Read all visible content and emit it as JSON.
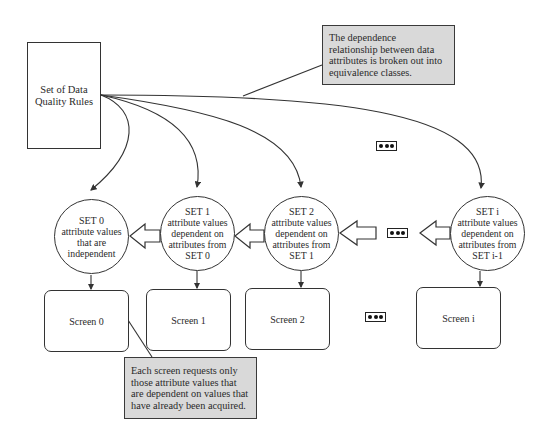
{
  "rules_box": {
    "label_line1": "Set of Data",
    "label_line2": "Quality Rules"
  },
  "callouts": {
    "top": {
      "lines": [
        "The dependence",
        "relationship between data",
        "attributes is broken out into",
        "equivalence classes."
      ]
    },
    "bottom": {
      "lines": [
        "Each screen requests only",
        "those attribute values that",
        "are dependent on values that",
        "have already been acquired."
      ]
    }
  },
  "sets": [
    {
      "title": "SET 0",
      "lines": [
        "attribute values",
        "that are",
        "independent"
      ]
    },
    {
      "title": "SET 1",
      "lines": [
        "attribute values",
        "dependent on",
        "attributes from",
        "SET 0"
      ]
    },
    {
      "title": "SET 2",
      "lines": [
        "attribute values",
        "dependent on",
        "attributes from",
        "SET 1"
      ]
    },
    {
      "title": "SET i",
      "lines": [
        "attribute values",
        "dependent on",
        "attributes from",
        "SET i-1"
      ]
    }
  ],
  "screens": [
    "Screen 0",
    "Screen 1",
    "Screen 2",
    "Screen i"
  ],
  "ellipsis_icons": [
    "ellipsis-icon",
    "ellipsis-icon",
    "ellipsis-icon"
  ],
  "colors": {
    "callout_fill": "#d9d9d9",
    "stroke": "#333333",
    "background": "#ffffff"
  }
}
